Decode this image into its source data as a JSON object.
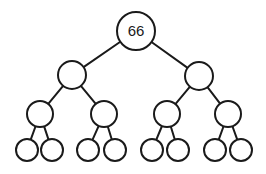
{
  "diagram": {
    "type": "binary-tree",
    "depth": 4,
    "colors": {
      "stroke": "#1a1a1a",
      "fill": "#ffffff",
      "background": "#ffffff"
    },
    "nodes": [
      {
        "id": "n0",
        "label": "66",
        "cx": 136,
        "cy": 31,
        "r": 19
      },
      {
        "id": "n1",
        "label": "",
        "cx": 72,
        "cy": 75,
        "r": 14
      },
      {
        "id": "n2",
        "label": "",
        "cx": 199,
        "cy": 76,
        "r": 14
      },
      {
        "id": "n3",
        "label": "",
        "cx": 40,
        "cy": 114,
        "r": 13
      },
      {
        "id": "n4",
        "label": "",
        "cx": 104,
        "cy": 114,
        "r": 13
      },
      {
        "id": "n5",
        "label": "",
        "cx": 167,
        "cy": 114,
        "r": 13
      },
      {
        "id": "n6",
        "label": "",
        "cx": 228,
        "cy": 114,
        "r": 13
      },
      {
        "id": "n7",
        "label": "",
        "cx": 27,
        "cy": 150,
        "r": 11
      },
      {
        "id": "n8",
        "label": "",
        "cx": 52,
        "cy": 150,
        "r": 11
      },
      {
        "id": "n9",
        "label": "",
        "cx": 88,
        "cy": 150,
        "r": 11
      },
      {
        "id": "n10",
        "label": "",
        "cx": 115,
        "cy": 150,
        "r": 11
      },
      {
        "id": "n11",
        "label": "",
        "cx": 152,
        "cy": 150,
        "r": 11
      },
      {
        "id": "n12",
        "label": "",
        "cx": 178,
        "cy": 150,
        "r": 11
      },
      {
        "id": "n13",
        "label": "",
        "cx": 215,
        "cy": 150,
        "r": 11
      },
      {
        "id": "n14",
        "label": "",
        "cx": 241,
        "cy": 150,
        "r": 11
      }
    ],
    "edges": [
      [
        "n0",
        "n1"
      ],
      [
        "n0",
        "n2"
      ],
      [
        "n1",
        "n3"
      ],
      [
        "n1",
        "n4"
      ],
      [
        "n2",
        "n5"
      ],
      [
        "n2",
        "n6"
      ],
      [
        "n3",
        "n7"
      ],
      [
        "n3",
        "n8"
      ],
      [
        "n4",
        "n9"
      ],
      [
        "n4",
        "n10"
      ],
      [
        "n5",
        "n11"
      ],
      [
        "n5",
        "n12"
      ],
      [
        "n6",
        "n13"
      ],
      [
        "n6",
        "n14"
      ]
    ]
  }
}
